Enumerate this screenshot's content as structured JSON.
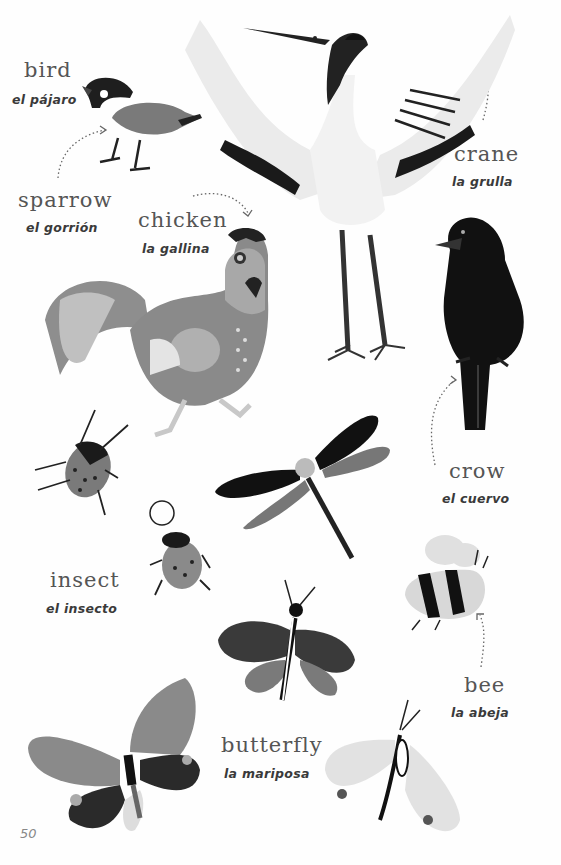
{
  "page": {
    "number": "50",
    "colors": {
      "background": "#fefefe",
      "dark": "#1a1a1a",
      "mid_gray": "#7c7c7c",
      "light_gray": "#d8d8d8",
      "text": "#555555"
    }
  },
  "labels": [
    {
      "id": "bird",
      "english": "bird",
      "spanish": "el pájaro"
    },
    {
      "id": "sparrow",
      "english": "sparrow",
      "spanish": "el gorrión"
    },
    {
      "id": "chicken",
      "english": "chicken",
      "spanish": "la gallina"
    },
    {
      "id": "crane",
      "english": "crane",
      "spanish": "la grulla"
    },
    {
      "id": "crow",
      "english": "crow",
      "spanish": "el cuervo"
    },
    {
      "id": "insect",
      "english": "insect",
      "spanish": "el insecto"
    },
    {
      "id": "bee",
      "english": "bee",
      "spanish": "la abeja"
    },
    {
      "id": "butterfly",
      "english": "butterfly",
      "spanish": "la mariposa"
    }
  ],
  "illustrations": [
    "sparrow-illustration",
    "crane-illustration",
    "chicken-illustration",
    "crow-illustration",
    "beetle-illustration",
    "bug-illustration",
    "dragonfly-illustration",
    "bee-illustration",
    "moth-illustration",
    "butterfly-illustration",
    "white-moth-illustration"
  ]
}
